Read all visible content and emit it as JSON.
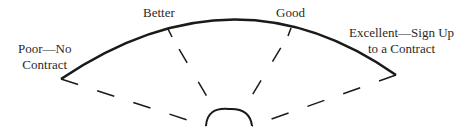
{
  "diagram": {
    "type": "fan-scale",
    "labels": {
      "poor": [
        "Poor—No",
        "Contract"
      ],
      "better": "Better",
      "good": "Good",
      "excellent": [
        "Excellent—Sign Up",
        "to a Contract"
      ]
    },
    "scale_order": [
      "Poor—No Contract",
      "Better",
      "Good",
      "Excellent—Sign Up to a Contract"
    ],
    "colors": {
      "stroke": "#1a1a1a",
      "text": "#2a2a2a",
      "background": "#ffffff"
    }
  }
}
